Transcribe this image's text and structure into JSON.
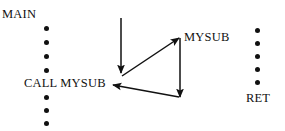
{
  "diagram": {
    "background_color": "#ffffff",
    "ink_color": "#111111",
    "labels": {
      "main": "MAIN",
      "call": "CALL MYSUB",
      "mysub": "MYSUB",
      "ret": "RET"
    },
    "dot_columns": [
      {
        "name": "main-dots-above-call",
        "count": 4,
        "x": 46,
        "y_start": 26,
        "spacing": 14
      },
      {
        "name": "main-dots-below-call",
        "count": 3,
        "x": 46,
        "y_start": 95,
        "spacing": 13
      },
      {
        "name": "mysub-dots",
        "count": 5,
        "x": 257,
        "y_start": 28,
        "spacing": 13
      }
    ],
    "arrows": [
      {
        "name": "main-flow-down-arrow",
        "from": [
          121,
          18
        ],
        "to": [
          121,
          73
        ],
        "description": "vertical arrow descending through MAIN toward CALL MYSUB"
      },
      {
        "name": "call-to-mysub-arrow",
        "from": [
          122,
          76
        ],
        "to": [
          179,
          38
        ],
        "description": "diagonal arrow from CALL MYSUB up to MYSUB entry"
      },
      {
        "name": "mysub-body-down-arrow",
        "from": [
          180,
          38
        ],
        "to": [
          180,
          97
        ],
        "description": "vertical arrow descending through MYSUB to RET"
      },
      {
        "name": "return-to-main-arrow",
        "from": [
          179,
          97
        ],
        "to": [
          113,
          85
        ],
        "description": "return arrow from RET back to MAIN after CALL MYSUB"
      }
    ]
  }
}
